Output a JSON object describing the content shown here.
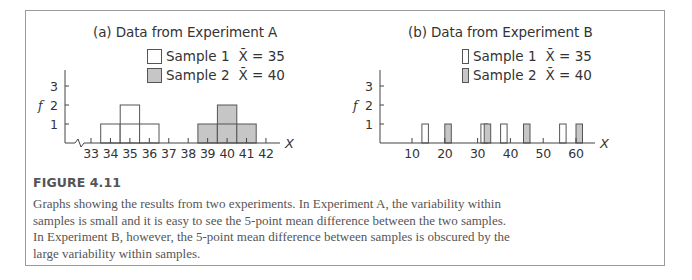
{
  "figure": {
    "label": "FIGURE 4.11",
    "caption_lines": [
      "Graphs showing the results from two experiments. In Experiment A, the variability within",
      "samples is small and it is easy to see the 5-point mean difference between the two samples.",
      "In Experiment B, however, the 5-point mean difference between samples is obscured by the",
      "large variability within samples."
    ]
  },
  "colors": {
    "sample1_fill": "#ffffff",
    "sample2_fill": "#c6c6c6",
    "outline": "#555555",
    "axis": "#444444",
    "frame": "#9a9a9a"
  },
  "chart_data": [
    {
      "type": "bar",
      "title": "(a) Data from Experiment A",
      "xlabel": "X",
      "ylabel": "f",
      "x_ticks": [
        33,
        34,
        35,
        36,
        37,
        38,
        39,
        40,
        41,
        42
      ],
      "y_ticks": [
        1,
        2,
        3
      ],
      "xlim": [
        32.2,
        42.8
      ],
      "ylim": [
        0,
        3.8
      ],
      "axis_break": true,
      "grid": false,
      "legend_position": "top-right",
      "series": [
        {
          "name": "Sample 1",
          "mean_label": "X̄ = 35",
          "mean": 35,
          "fill": "white",
          "x": [
            34,
            35,
            36
          ],
          "values": [
            1,
            2,
            1
          ]
        },
        {
          "name": "Sample 2",
          "mean_label": "X̄ = 40",
          "mean": 40,
          "fill": "gray",
          "x": [
            39,
            40,
            41
          ],
          "values": [
            1,
            2,
            1
          ]
        }
      ]
    },
    {
      "type": "bar",
      "title": "(b) Data from Experiment B",
      "xlabel": "X",
      "ylabel": "f",
      "x_ticks": [
        10,
        20,
        30,
        40,
        50,
        60
      ],
      "y_ticks": [
        1,
        2,
        3
      ],
      "xlim": [
        0,
        70
      ],
      "ylim": [
        0,
        3.8
      ],
      "axis_break": false,
      "grid": false,
      "legend_position": "top-right",
      "series": [
        {
          "name": "Sample 1",
          "mean_label": "X̄ = 35",
          "mean": 35,
          "fill": "white",
          "x": [
            14,
            32,
            38,
            56
          ],
          "values": [
            1,
            1,
            1,
            1
          ]
        },
        {
          "name": "Sample 2",
          "mean_label": "X̄ = 40",
          "mean": 40,
          "fill": "gray",
          "x": [
            21,
            33,
            45,
            61
          ],
          "values": [
            1,
            1,
            1,
            1
          ]
        }
      ]
    }
  ]
}
